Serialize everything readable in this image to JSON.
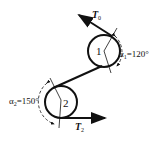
{
  "diagram": {
    "pulley1": {
      "label": "1",
      "angle_label": "α₁=120°",
      "angle_symbol": "α",
      "angle_sub": "1",
      "angle_value": "=120°"
    },
    "pulley2": {
      "label": "2",
      "angle_label": "α₂=150°",
      "angle_symbol": "α",
      "angle_sub": "2",
      "angle_value": "=150°"
    },
    "force_top": {
      "symbol": "T",
      "sub": "0"
    },
    "force_bottom": {
      "symbol": "T",
      "sub": "2"
    },
    "colors": {
      "line": "#111111",
      "background": "#ffffff"
    }
  }
}
